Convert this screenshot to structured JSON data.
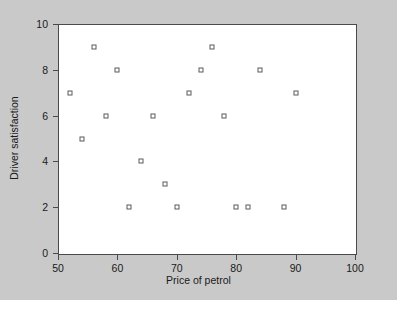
{
  "chart_data": {
    "type": "scatter",
    "title": "",
    "xlabel": "Price of petrol",
    "ylabel": "Driver satisfaction",
    "xlim": [
      50,
      100
    ],
    "ylim": [
      0,
      10
    ],
    "xticks": [
      50,
      60,
      70,
      80,
      90,
      100
    ],
    "yticks": [
      0,
      2,
      4,
      6,
      8,
      10
    ],
    "grid": false,
    "legend": null,
    "marker": "open-square",
    "marker_color": "#5a5a5a",
    "points": [
      {
        "x": 52,
        "y": 7
      },
      {
        "x": 54,
        "y": 5
      },
      {
        "x": 56,
        "y": 9
      },
      {
        "x": 58,
        "y": 6
      },
      {
        "x": 60,
        "y": 8
      },
      {
        "x": 62,
        "y": 2
      },
      {
        "x": 64,
        "y": 4
      },
      {
        "x": 66,
        "y": 6
      },
      {
        "x": 68,
        "y": 3
      },
      {
        "x": 70,
        "y": 2
      },
      {
        "x": 72,
        "y": 7
      },
      {
        "x": 74,
        "y": 8
      },
      {
        "x": 76,
        "y": 9
      },
      {
        "x": 78,
        "y": 6
      },
      {
        "x": 80,
        "y": 2
      },
      {
        "x": 82,
        "y": 2
      },
      {
        "x": 84,
        "y": 8
      },
      {
        "x": 88,
        "y": 2
      },
      {
        "x": 90,
        "y": 7
      }
    ]
  },
  "figure": {
    "background_color": "#c9c9c9",
    "plot_background_color": "#ffffff",
    "frame_color": "#4a4a4a"
  }
}
